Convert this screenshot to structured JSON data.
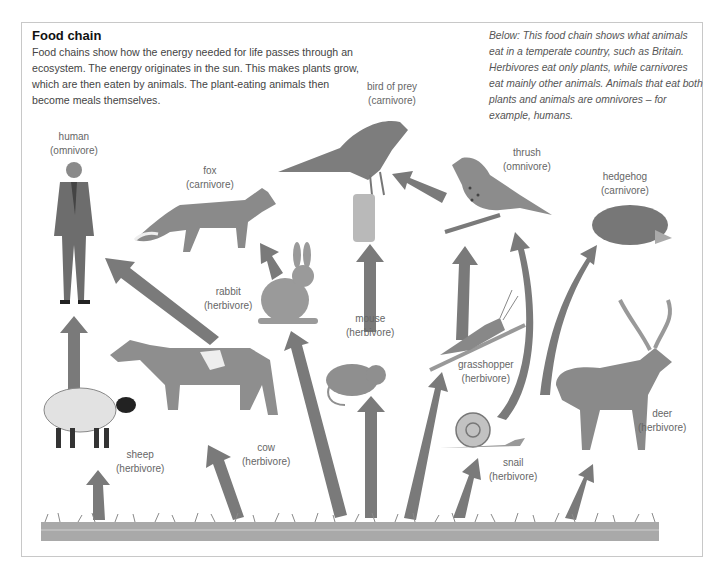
{
  "header": {
    "title": "Food chain",
    "intro": "Food chains show how the energy needed for life passes through an ecosystem. The energy originates in the sun. This makes plants grow, which are then eaten by animals. The plant-eating animals then become meals themselves."
  },
  "caption": "Below: This food chain shows what animals eat in a temperate country, such as Britain. Herbivores eat only plants, while carnivores eat mainly other animals. Animals that eat both plants and animals are omnivores – for example, humans.",
  "animals": [
    {
      "id": "human",
      "name": "human",
      "type": "(omnivore)"
    },
    {
      "id": "fox",
      "name": "fox",
      "type": "(carnivore)"
    },
    {
      "id": "bird_of_prey",
      "name": "bird of prey",
      "type": "(carnivore)"
    },
    {
      "id": "thrush",
      "name": "thrush",
      "type": "(omnivore)"
    },
    {
      "id": "hedgehog",
      "name": "hedgehog",
      "type": "(carnivore)"
    },
    {
      "id": "rabbit",
      "name": "rabbit",
      "type": "(herbivore)"
    },
    {
      "id": "mouse",
      "name": "mouse",
      "type": "(herbivore)"
    },
    {
      "id": "grasshopper",
      "name": "grasshopper",
      "type": "(herbivore)"
    },
    {
      "id": "cow",
      "name": "cow",
      "type": "(herbivore)"
    },
    {
      "id": "sheep",
      "name": "sheep",
      "type": "(herbivore)"
    },
    {
      "id": "snail",
      "name": "snail",
      "type": "(herbivore)"
    },
    {
      "id": "deer",
      "name": "deer",
      "type": "(herbivore)"
    }
  ],
  "links": [
    [
      "grass",
      "sheep"
    ],
    [
      "grass",
      "cow"
    ],
    [
      "grass",
      "rabbit"
    ],
    [
      "grass",
      "mouse"
    ],
    [
      "grass",
      "grasshopper"
    ],
    [
      "grass",
      "snail"
    ],
    [
      "grass",
      "deer"
    ],
    [
      "sheep",
      "human"
    ],
    [
      "cow",
      "human"
    ],
    [
      "rabbit",
      "fox"
    ],
    [
      "mouse",
      "bird_of_prey"
    ],
    [
      "grasshopper",
      "thrush"
    ],
    [
      "snail",
      "thrush"
    ],
    [
      "snail",
      "hedgehog"
    ],
    [
      "thrush",
      "bird_of_prey"
    ]
  ],
  "colors": {
    "arrow": "#7a7a7a",
    "frame": "#c8c8c8",
    "grass": "#8f8f8f"
  }
}
